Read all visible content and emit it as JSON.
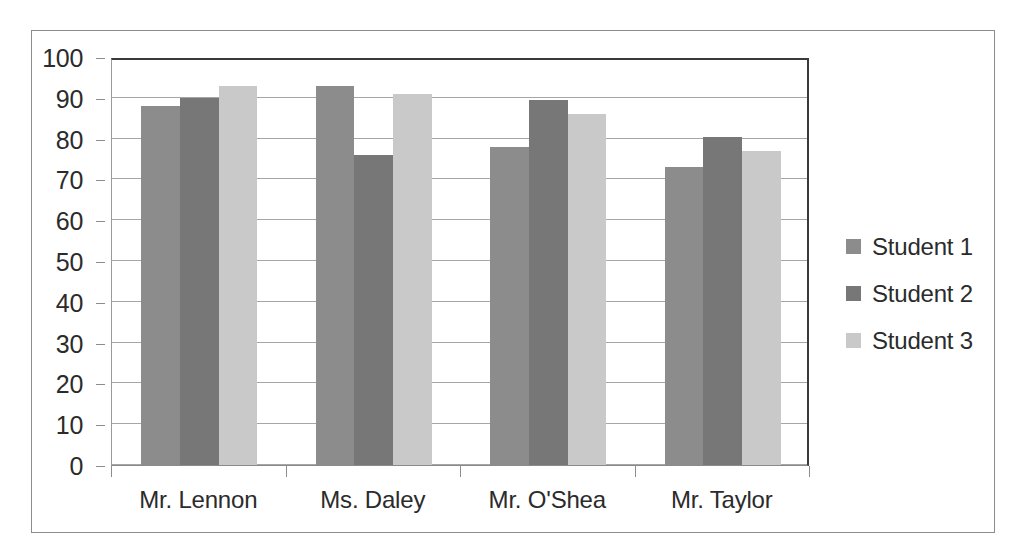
{
  "chart_data": {
    "type": "bar",
    "title": "",
    "subtitle": "",
    "xlabel": "",
    "ylabel": "",
    "categories": [
      "Mr. Lennon",
      "Ms. Daley",
      "Mr. O'Shea",
      "Mr. Taylor"
    ],
    "series": [
      {
        "name": "Student 1",
        "color": "#8c8c8c",
        "values": [
          88,
          93,
          78,
          73
        ]
      },
      {
        "name": "Student 2",
        "color": "#777777",
        "values": [
          90,
          76,
          89.5,
          80.5
        ]
      },
      {
        "name": "Student 3",
        "color": "#c9c9c9",
        "values": [
          93,
          91,
          86,
          77
        ]
      }
    ],
    "ylim": [
      0,
      100
    ],
    "ytick_step": 10,
    "yticks": [
      100,
      90,
      80,
      70,
      60,
      50,
      40,
      30,
      20,
      10,
      0
    ],
    "ytick_labels": [
      "100",
      "90",
      "80",
      "70",
      "60",
      "50",
      "40",
      "30",
      "20",
      "10",
      "0"
    ],
    "grid": true,
    "grid_axis": "y",
    "legend": true,
    "legend_position": "right",
    "plot_background": "#ffffff",
    "grid_color": "#a6a6a6",
    "axis_color": "#3a3a3a",
    "frame_color": "#8d8d8d"
  }
}
